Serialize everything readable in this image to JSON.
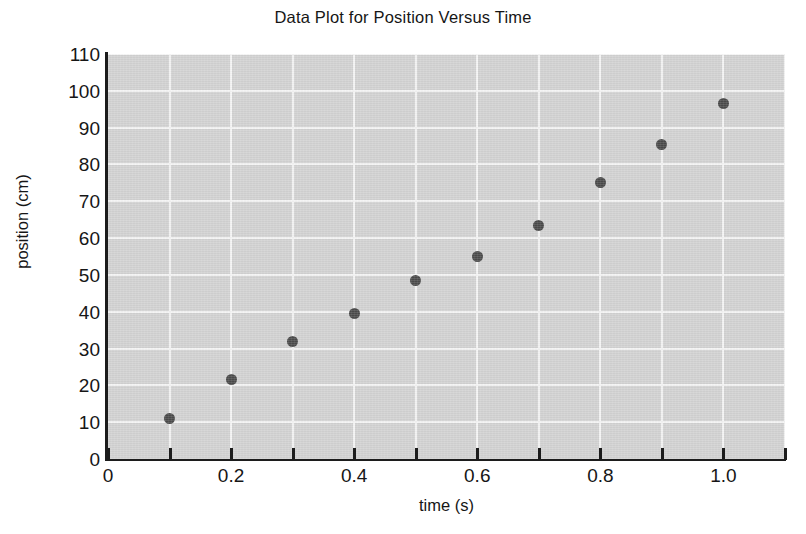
{
  "chart_data": {
    "type": "scatter",
    "title": "Data Plot for Position Versus Time",
    "xlabel": "time (s)",
    "ylabel": "position (cm)",
    "xlim": [
      0,
      1.1
    ],
    "ylim": [
      0,
      110
    ],
    "grid": true,
    "legend": null,
    "x": [
      0.1,
      0.2,
      0.3,
      0.4,
      0.5,
      0.6,
      0.7,
      0.8,
      0.9,
      1.0
    ],
    "y": [
      11,
      21.5,
      32,
      39.5,
      48.5,
      55,
      63.5,
      75,
      85.5,
      96.5
    ],
    "xticks": [
      0,
      0.2,
      0.4,
      0.6,
      0.8,
      1.0
    ],
    "xtick_labels": [
      "0",
      "0.2",
      "0.4",
      "0.6",
      "0.8",
      "1.0"
    ],
    "xtick_minor": [
      0.1,
      0.3,
      0.5,
      0.7,
      0.9,
      1.1
    ],
    "yticks": [
      0,
      10,
      20,
      30,
      40,
      50,
      60,
      70,
      80,
      90,
      100,
      110
    ],
    "ytick_labels": [
      "0",
      "10",
      "20",
      "30",
      "40",
      "50",
      "60",
      "70",
      "80",
      "90",
      "100",
      "110"
    ],
    "marker": "circle",
    "marker_color": "#4a4a4a",
    "plot_background": "#d2d2d2",
    "gridline_color": "#f4f4f4",
    "axis_color": "#1c1c1c"
  }
}
